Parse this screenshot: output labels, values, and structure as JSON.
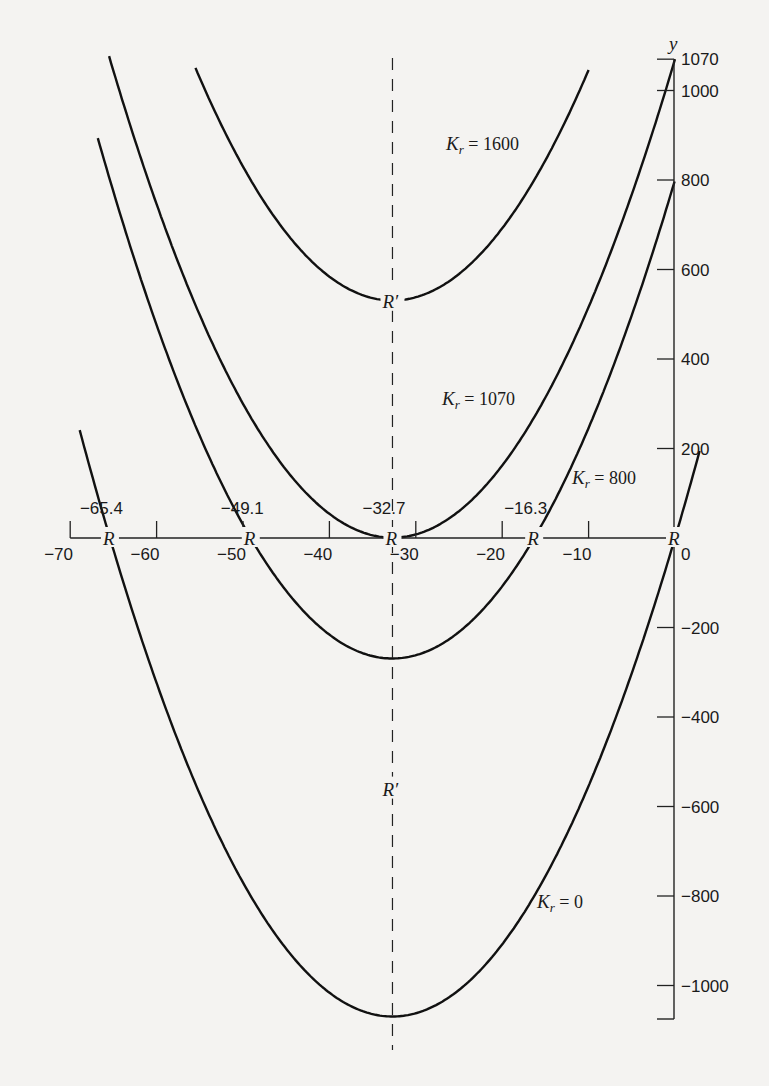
{
  "chart_data": {
    "type": "line",
    "title": "",
    "xlabel": "",
    "ylabel": "y",
    "xlim": [
      -70,
      0
    ],
    "ylim": [
      -1070,
      1070
    ],
    "grid": false,
    "equation": "y = x^2 + 65.4x + K_r",
    "x_ticks": [
      -70,
      -60,
      -50,
      -40,
      -30,
      -20,
      -10,
      0
    ],
    "x_tick_labels": [
      "−70",
      "−60",
      "−50",
      "−40",
      "−30",
      "−20",
      "−10",
      "0"
    ],
    "y_ticks": [
      1070,
      1000,
      800,
      600,
      400,
      200,
      -200,
      -400,
      -600,
      -800,
      -1000
    ],
    "y_tick_labels": [
      "1070",
      "1000",
      "800",
      "600",
      "400",
      "200",
      "−200",
      "−400",
      "−600",
      "−800",
      "−1000"
    ],
    "axis_annotations": [
      "−65.4",
      "−49.1",
      "−32.7",
      "−16.3"
    ],
    "root_marker": "R",
    "vertex_marker": "R′",
    "symmetry_axis_x": -32.7,
    "series": [
      {
        "name": "K_r = 0",
        "label_text": "= 0",
        "K": 0,
        "roots": [
          -65.4,
          0
        ],
        "vertex": [
          -32.7,
          -1070
        ]
      },
      {
        "name": "K_r = 800",
        "label_text": "= 800",
        "K": 800,
        "roots": [
          -49.1,
          -16.3
        ],
        "vertex": [
          -32.7,
          -269
        ]
      },
      {
        "name": "K_r = 1070",
        "label_text": "= 1070",
        "K": 1070,
        "roots": [
          -32.7
        ],
        "vertex": [
          -32.7,
          0
        ]
      },
      {
        "name": "K_r = 1600",
        "label_text": "= 1600",
        "K": 1600,
        "roots": [],
        "vertex": [
          -32.7,
          530
        ]
      }
    ]
  }
}
